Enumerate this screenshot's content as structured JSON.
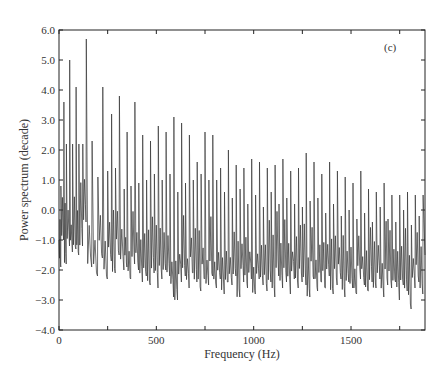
{
  "chart_data": {
    "type": "line",
    "title": "",
    "panel_label": "(c)",
    "xlabel": "Frequency (Hz)",
    "ylabel": "Power spectrum (decade)",
    "xlim": [
      0,
      1880
    ],
    "ylim": [
      -4.0,
      6.0
    ],
    "xticks": [
      0,
      500,
      1000,
      1500
    ],
    "xtick_labels": [
      "0",
      "500",
      "1000",
      "1500"
    ],
    "yticks": [
      6.0,
      5.0,
      4.0,
      3.0,
      2.0,
      1.0,
      0.0,
      -1.0,
      -2.0,
      -3.0,
      -4.0
    ],
    "ytick_labels": [
      "6.0",
      "5.0",
      "4.0",
      "3.0",
      "2.0",
      "1.0",
      "0.0",
      "−1.0",
      "−2.0",
      "−3.0",
      "−4.0"
    ],
    "grid": false,
    "legend": null,
    "series": [
      {
        "name": "Power spectrum",
        "description": "Harmonic peaks decaying with frequency over a noisy baseline",
        "peaks": [
          {
            "x": 10,
            "y": 0.8
          },
          {
            "x": 25,
            "y": 3.6
          },
          {
            "x": 38,
            "y": 2.2
          },
          {
            "x": 55,
            "y": 5.0
          },
          {
            "x": 70,
            "y": 2.2
          },
          {
            "x": 88,
            "y": 4.1
          },
          {
            "x": 102,
            "y": 2.2
          },
          {
            "x": 122,
            "y": 2.2
          },
          {
            "x": 140,
            "y": 5.7
          },
          {
            "x": 170,
            "y": 2.3
          },
          {
            "x": 200,
            "y": 1.1
          },
          {
            "x": 225,
            "y": 4.1
          },
          {
            "x": 250,
            "y": 1.3
          },
          {
            "x": 270,
            "y": 3.2
          },
          {
            "x": 290,
            "y": 1.4
          },
          {
            "x": 310,
            "y": 3.8
          },
          {
            "x": 335,
            "y": 0.7
          },
          {
            "x": 350,
            "y": 2.6
          },
          {
            "x": 370,
            "y": 0.8
          },
          {
            "x": 390,
            "y": 3.6
          },
          {
            "x": 410,
            "y": 0.9
          },
          {
            "x": 430,
            "y": 2.5
          },
          {
            "x": 450,
            "y": 1.0
          },
          {
            "x": 470,
            "y": 2.3
          },
          {
            "x": 490,
            "y": 1.2
          },
          {
            "x": 510,
            "y": 2.8
          },
          {
            "x": 530,
            "y": 1.0
          },
          {
            "x": 550,
            "y": 2.6
          },
          {
            "x": 570,
            "y": 1.2
          },
          {
            "x": 590,
            "y": 3.1
          },
          {
            "x": 610,
            "y": 0.6
          },
          {
            "x": 630,
            "y": 2.9
          },
          {
            "x": 650,
            "y": 0.9
          },
          {
            "x": 670,
            "y": 2.5
          },
          {
            "x": 690,
            "y": 1.0
          },
          {
            "x": 710,
            "y": 1.6
          },
          {
            "x": 730,
            "y": 1.2
          },
          {
            "x": 750,
            "y": 2.6
          },
          {
            "x": 770,
            "y": 1.0
          },
          {
            "x": 790,
            "y": 2.5
          },
          {
            "x": 810,
            "y": 1.0
          },
          {
            "x": 830,
            "y": 1.4
          },
          {
            "x": 850,
            "y": 0.6
          },
          {
            "x": 870,
            "y": 2.0
          },
          {
            "x": 890,
            "y": 0.4
          },
          {
            "x": 910,
            "y": 1.5
          },
          {
            "x": 930,
            "y": 0.7
          },
          {
            "x": 950,
            "y": 1.4
          },
          {
            "x": 970,
            "y": 0.2
          },
          {
            "x": 990,
            "y": 1.7
          },
          {
            "x": 1010,
            "y": 0.5
          },
          {
            "x": 1030,
            "y": 1.6
          },
          {
            "x": 1050,
            "y": 0.1
          },
          {
            "x": 1070,
            "y": 1.4
          },
          {
            "x": 1090,
            "y": 0.6
          },
          {
            "x": 1110,
            "y": 1.5
          },
          {
            "x": 1130,
            "y": 0.2
          },
          {
            "x": 1150,
            "y": 1.7
          },
          {
            "x": 1170,
            "y": 0.4
          },
          {
            "x": 1190,
            "y": 1.3
          },
          {
            "x": 1210,
            "y": 0.2
          },
          {
            "x": 1230,
            "y": 1.4
          },
          {
            "x": 1250,
            "y": 0.1
          },
          {
            "x": 1270,
            "y": 1.9
          },
          {
            "x": 1290,
            "y": 0.3
          },
          {
            "x": 1310,
            "y": 1.6
          },
          {
            "x": 1330,
            "y": 0.4
          },
          {
            "x": 1350,
            "y": 1.2
          },
          {
            "x": 1370,
            "y": -0.1
          },
          {
            "x": 1390,
            "y": 1.6
          },
          {
            "x": 1410,
            "y": 0.2
          },
          {
            "x": 1430,
            "y": 1.3
          },
          {
            "x": 1450,
            "y": -0.2
          },
          {
            "x": 1470,
            "y": 1.1
          },
          {
            "x": 1490,
            "y": 0.0
          },
          {
            "x": 1510,
            "y": 0.9
          },
          {
            "x": 1530,
            "y": -0.3
          },
          {
            "x": 1550,
            "y": 1.3
          },
          {
            "x": 1570,
            "y": -0.1
          },
          {
            "x": 1590,
            "y": 0.7
          },
          {
            "x": 1610,
            "y": -0.4
          },
          {
            "x": 1630,
            "y": 0.6
          },
          {
            "x": 1650,
            "y": 0.1
          },
          {
            "x": 1670,
            "y": 0.9
          },
          {
            "x": 1690,
            "y": -0.3
          },
          {
            "x": 1710,
            "y": 0.5
          },
          {
            "x": 1730,
            "y": -0.4
          },
          {
            "x": 1750,
            "y": 0.5
          },
          {
            "x": 1770,
            "y": 0.0
          },
          {
            "x": 1790,
            "y": 0.6
          },
          {
            "x": 1810,
            "y": -0.5
          },
          {
            "x": 1830,
            "y": 0.5
          },
          {
            "x": 1850,
            "y": -0.2
          },
          {
            "x": 1870,
            "y": 0.5
          }
        ],
        "troughs": [
          -1.9,
          -1.0,
          -1.8,
          -1.2,
          -1.4,
          -1.3,
          -1.5,
          -1.2,
          -0.4,
          -1.9,
          -2.2,
          -1.6,
          -2.3,
          -1.7,
          -2.1,
          -1.5,
          -2.0,
          -1.9,
          -2.3,
          -1.8,
          -2.0,
          -2.4,
          -2.2,
          -2.5,
          -2.1,
          -2.6,
          -2.3,
          -2.0,
          -2.2,
          -2.9,
          -3.0,
          -2.4,
          -2.2,
          -2.6,
          -2.1,
          -2.4,
          -2.7,
          -2.3,
          -2.5,
          -2.2,
          -2.6,
          -2.3,
          -2.8,
          -2.4,
          -2.5,
          -2.2,
          -2.9,
          -2.4,
          -2.6,
          -2.3,
          -2.8,
          -2.3,
          -2.5,
          -2.7,
          -2.4,
          -2.9,
          -2.2,
          -2.6,
          -2.4,
          -2.8,
          -2.3,
          -2.6,
          -2.4,
          -2.5,
          -2.9,
          -2.3,
          -2.7,
          -2.4,
          -2.6,
          -2.2,
          -2.8,
          -2.5,
          -2.3,
          -2.9,
          -2.4,
          -2.6,
          -2.8,
          -2.3,
          -2.5,
          -2.7,
          -2.4,
          -2.6,
          -2.3,
          -2.9,
          -2.5,
          -2.6,
          -2.4,
          -3.0,
          -2.5,
          -2.7,
          -3.3,
          -2.6,
          -2.4,
          -2.8
        ]
      }
    ]
  }
}
